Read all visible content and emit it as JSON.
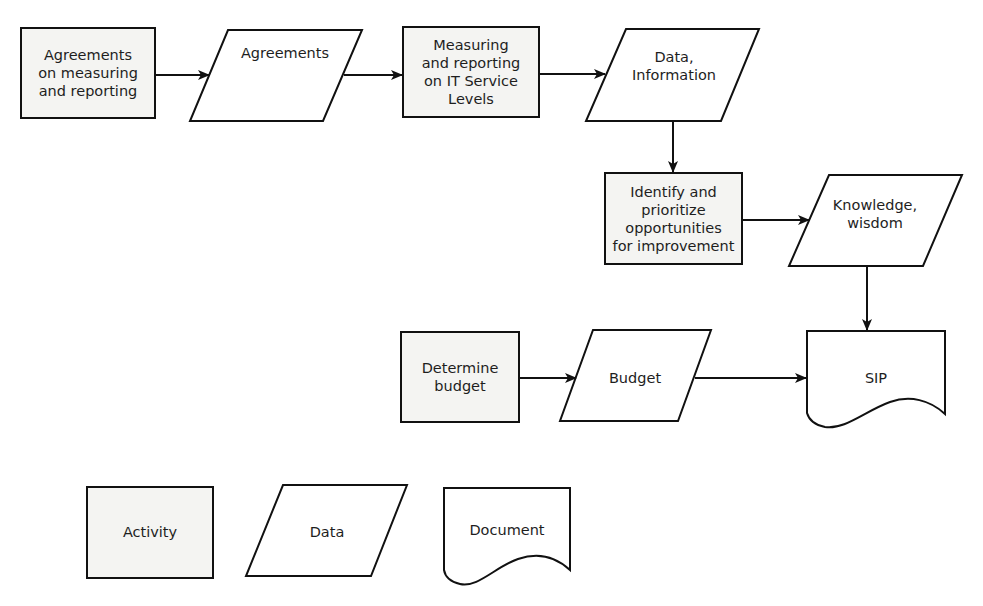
{
  "diagram": {
    "type": "flowchart",
    "nodes": {
      "agreements_activity": {
        "label": "Agreements\non measuring\nand reporting",
        "kind": "activity"
      },
      "agreements_data": {
        "label": "Agreements",
        "kind": "data"
      },
      "measuring_activity": {
        "label": "Measuring\nand reporting\non IT Service\nLevels",
        "kind": "activity"
      },
      "data_information": {
        "label": "Data,\nInformation",
        "kind": "data"
      },
      "identify_activity": {
        "label": "Identify and\nprioritize\nopportunities\nfor improvement",
        "kind": "activity"
      },
      "knowledge_wisdom": {
        "label": "Knowledge,\nwisdom",
        "kind": "data"
      },
      "determine_budget": {
        "label": "Determine\nbudget",
        "kind": "activity"
      },
      "budget_data": {
        "label": "Budget",
        "kind": "data"
      },
      "sip_document": {
        "label": "SIP",
        "kind": "document"
      }
    },
    "edges": [
      {
        "from": "agreements_activity",
        "to": "agreements_data"
      },
      {
        "from": "agreements_data",
        "to": "measuring_activity"
      },
      {
        "from": "measuring_activity",
        "to": "data_information"
      },
      {
        "from": "data_information",
        "to": "identify_activity"
      },
      {
        "from": "identify_activity",
        "to": "knowledge_wisdom"
      },
      {
        "from": "knowledge_wisdom",
        "to": "sip_document"
      },
      {
        "from": "determine_budget",
        "to": "budget_data"
      },
      {
        "from": "budget_data",
        "to": "sip_document"
      }
    ]
  },
  "legend": {
    "activity": "Activity",
    "data": "Data",
    "document": "Document"
  },
  "colors": {
    "stroke": "#111111",
    "activity_fill": "#f4f4f2",
    "data_fill": "#ffffff",
    "text": "#1e1e1e"
  }
}
